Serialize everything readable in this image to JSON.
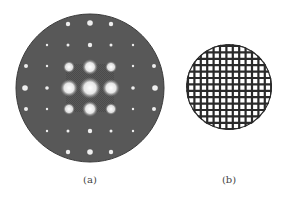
{
  "figure": {
    "panels": [
      {
        "label": "(a)",
        "description": "diffraction-pattern",
        "background_color": "#555555",
        "center": [
          90,
          88
        ],
        "radius": 74,
        "spot_spacing": 21,
        "spot_color": "#f2f2f2"
      },
      {
        "label": "(b)",
        "description": "square-mesh-grid",
        "background_color": "#ffffff",
        "line_color": "#2a2a2a",
        "center": [
          229,
          87
        ],
        "radius": 43,
        "grid_pitch": 6.4
      }
    ]
  }
}
